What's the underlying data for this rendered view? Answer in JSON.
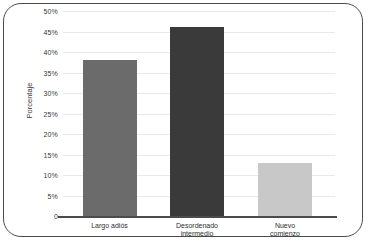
{
  "chart_data": {
    "type": "bar",
    "title": "",
    "subtitle": "",
    "xlabel": "",
    "ylabel": "Porcentaje",
    "categories": [
      "Largo adiós",
      "Desordenado\nintermedio",
      "Nuevo\ncomienzo"
    ],
    "values": [
      38,
      46,
      13
    ],
    "value_labels": [
      "38%",
      "46%",
      "13%"
    ],
    "ylim": [
      0,
      50
    ],
    "ytick_values": [
      0,
      5,
      10,
      15,
      20,
      25,
      30,
      35,
      40,
      45,
      50
    ],
    "ytick_labels": [
      "0",
      "5%",
      "10%",
      "15%",
      "20%",
      "25%",
      "30%",
      "35%",
      "40%",
      "45%",
      "50%"
    ],
    "grid": true,
    "legend": false,
    "legend_position": "none",
    "bar_colors": [
      "#6b6b6b",
      "#3a3a3a",
      "#c8c8c8"
    ],
    "gridline_color": "#e9e9e9",
    "axis_color": "#4b4b4b",
    "frame_color": "#4a4a4a",
    "background": "#ffffff"
  }
}
